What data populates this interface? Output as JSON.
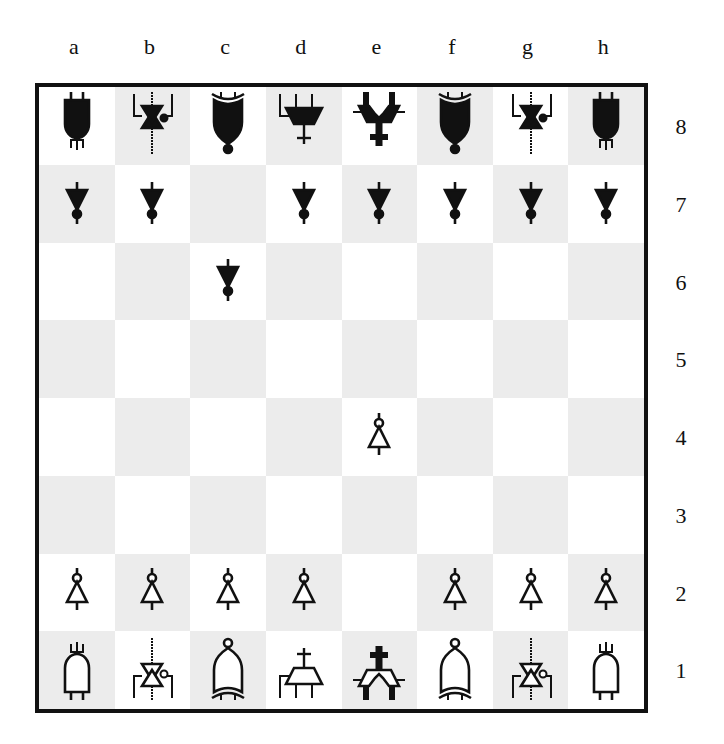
{
  "board": {
    "files": [
      "a",
      "b",
      "c",
      "d",
      "e",
      "f",
      "g",
      "h"
    ],
    "ranks": [
      "8",
      "7",
      "6",
      "5",
      "4",
      "3",
      "2",
      "1"
    ],
    "colors": {
      "light_square": "#ffffff",
      "dark_square": "#ececec",
      "border": "#111111",
      "black_piece": "#111111",
      "white_piece_fill": "#ffffff"
    },
    "piece_style": "logic-gate symbols",
    "position": [
      [
        "bR",
        "bN",
        "bB",
        "bQ",
        "bK",
        "bB",
        "bN",
        "bR"
      ],
      [
        "bP",
        "bP",
        "",
        "bP",
        "bP",
        "bP",
        "bP",
        "bP"
      ],
      [
        "",
        "",
        "bP",
        "",
        "",
        "",
        "",
        ""
      ],
      [
        "",
        "",
        "",
        "",
        "",
        "",
        "",
        ""
      ],
      [
        "",
        "",
        "",
        "",
        "wP",
        "",
        "",
        ""
      ],
      [
        "",
        "",
        "",
        "",
        "",
        "",
        "",
        ""
      ],
      [
        "wP",
        "wP",
        "wP",
        "wP",
        "",
        "wP",
        "wP",
        "wP"
      ],
      [
        "wR",
        "wN",
        "wB",
        "wQ",
        "wK",
        "wB",
        "wN",
        "wR"
      ]
    ],
    "piece_names": {
      "P": "pawn (buffer/NOT gate)",
      "R": "rook (AND gate)",
      "N": "knight (XOR-star gate)",
      "B": "bishop (OR gate)",
      "Q": "queen (multiplexer)",
      "K": "king (dual-input adder)"
    }
  }
}
